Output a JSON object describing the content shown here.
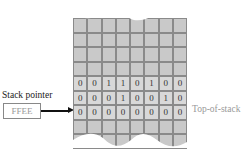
{
  "stack_pointer": {
    "label": "Stack pointer",
    "value": "FFEE"
  },
  "top_of_stack_label": "Top-of-stack",
  "memory": {
    "columns": 8,
    "rows": [
      {
        "bits": [
          "",
          "",
          "",
          "",
          "",
          "",
          "",
          ""
        ]
      },
      {
        "bits": [
          "",
          "",
          "",
          "",
          "",
          "",
          "",
          ""
        ]
      },
      {
        "bits": [
          "",
          "",
          "",
          "",
          "",
          "",
          "",
          ""
        ]
      },
      {
        "bits": [
          "",
          "",
          "",
          "",
          "",
          "",
          "",
          ""
        ]
      },
      {
        "bits": [
          "0",
          "0",
          "1",
          "1",
          "0",
          "1",
          "0",
          "0"
        ]
      },
      {
        "bits": [
          "0",
          "0",
          "0",
          "1",
          "0",
          "0",
          "1",
          "0"
        ]
      },
      {
        "bits": [
          "0",
          "0",
          "0",
          "0",
          "0",
          "0",
          "0",
          "0"
        ]
      },
      {
        "bits": [
          "",
          "",
          "",
          "",
          "",
          "",
          "",
          ""
        ]
      },
      {
        "bits": [
          "",
          "",
          "",
          "",
          "",
          "",
          "",
          ""
        ]
      }
    ]
  }
}
